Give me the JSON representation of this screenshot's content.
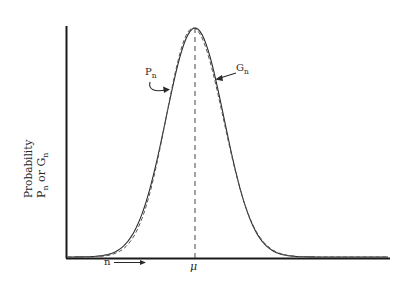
{
  "chart_data": {
    "type": "line",
    "title": "",
    "xlabel": "n",
    "ylabel": "Probability  P_n or G_n",
    "ylabel_line1": "Probability",
    "ylabel_line2_a": "P",
    "ylabel_line2_sub_a": "n",
    "ylabel_line2_mid": " or G",
    "ylabel_line2_sub_b": "n",
    "x_axis_annotation": "n",
    "x_axis_arrow": "⟶",
    "mean_label": "μ",
    "grid": false,
    "legend": "inline annotations with curved arrows",
    "annotations": [
      {
        "text": "P",
        "sub": "n",
        "points_to": "dashed curve (left flank)"
      },
      {
        "text": "G",
        "sub": "n",
        "points_to": "solid curve (right flank)"
      }
    ],
    "series": [
      {
        "name": "P_n",
        "style": "dashed",
        "shape": "bell-shaped, slightly skewed, peak at μ"
      },
      {
        "name": "G_n",
        "style": "solid",
        "shape": "Gaussian approximation, peak at μ"
      }
    ],
    "x": [
      -4,
      -3.5,
      -3,
      -2.5,
      -2,
      -1.5,
      -1,
      -0.5,
      0,
      0.5,
      1,
      1.5,
      2,
      2.5,
      3,
      3.5,
      4,
      4.5,
      5
    ],
    "x_units": "standard deviations from μ (relative, no tick values shown)",
    "G_n_relative": [
      0.0003,
      0.002,
      0.011,
      0.044,
      0.135,
      0.325,
      0.607,
      0.882,
      1.0,
      0.882,
      0.607,
      0.325,
      0.135,
      0.044,
      0.011,
      0.002,
      0.0003,
      0.0,
      0.0
    ],
    "P_n_relative": [
      0.0001,
      0.001,
      0.006,
      0.03,
      0.11,
      0.3,
      0.6,
      0.89,
      1.0,
      0.89,
      0.62,
      0.34,
      0.15,
      0.055,
      0.018,
      0.006,
      0.002,
      0.001,
      0.0
    ],
    "ylim": [
      0,
      1
    ],
    "mean_marker": "vertical dashed line at μ"
  }
}
